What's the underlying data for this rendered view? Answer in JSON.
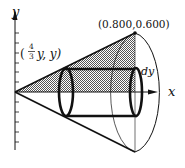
{
  "figure": {
    "type": "cone-volume-shell-method",
    "axes": {
      "x_label": "x",
      "y_label": "y"
    },
    "labels": {
      "apex_point": "(0.800,0.600)",
      "shell_point_open": "(",
      "shell_point_num": "4",
      "shell_point_den": "3",
      "shell_point_rest": "y, y)",
      "thickness": "dy"
    },
    "colors": {
      "stroke": "#111111",
      "shade": "#8c8c8c",
      "background": "#ffffff"
    }
  }
}
